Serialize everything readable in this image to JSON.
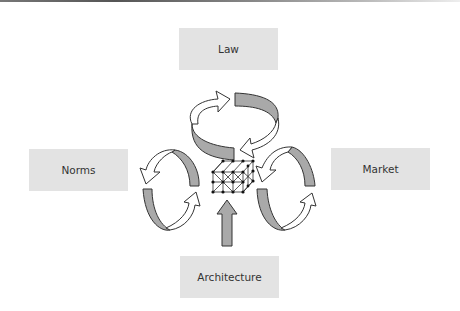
{
  "diagram": {
    "title": "",
    "nodes": [
      {
        "id": "law",
        "label": "Law",
        "position": "top"
      },
      {
        "id": "norms",
        "label": "Norms",
        "position": "left"
      },
      {
        "id": "market",
        "label": "Market",
        "position": "right"
      },
      {
        "id": "architecture",
        "label": "Architecture",
        "position": "bottom"
      }
    ],
    "center": {
      "icon": "lattice-grid-icon",
      "label": ""
    },
    "edges": [
      {
        "from": "law",
        "to": "center",
        "type": "circular-arrows"
      },
      {
        "from": "norms",
        "to": "center",
        "type": "circular-arrows"
      },
      {
        "from": "market",
        "to": "center",
        "type": "circular-arrows"
      },
      {
        "from": "architecture",
        "to": "center",
        "type": "up-arrow"
      }
    ],
    "colors": {
      "box_fill": "#e3e3e3",
      "arrow_fill": "#a9a9a9",
      "arrow_stroke": "#333333",
      "text": "#333333"
    }
  }
}
